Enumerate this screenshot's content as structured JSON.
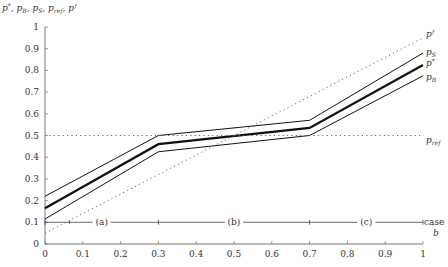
{
  "chart_data": {
    "type": "line",
    "title": "",
    "xlabel": "b",
    "ylabel": "p*, p_B, p_S, p_ref, p†",
    "xlim": [
      0,
      1
    ],
    "ylim": [
      0,
      1
    ],
    "grid": false,
    "x_ticks": [
      0,
      0.1,
      0.2,
      0.3,
      0.4,
      0.5,
      0.6,
      0.7,
      0.8,
      0.9,
      1
    ],
    "x_tick_labels": [
      "0",
      "0.1",
      "0.2",
      "0.3",
      "0.4",
      "0.5",
      "0.6",
      "0.7",
      "0.8",
      "0.9",
      "1"
    ],
    "y_ticks": [
      0,
      0.1,
      0.2,
      0.3,
      0.4,
      0.5,
      0.6,
      0.7,
      0.8,
      0.9,
      1
    ],
    "y_tick_labels": [
      "0",
      "0.1",
      "0.2",
      "0.3",
      "0.4",
      "0.5",
      "0.6",
      "0.7",
      "0.8",
      "0.9",
      "1"
    ],
    "series": [
      {
        "name": "p_S",
        "label": "pS",
        "style": "solid",
        "width": 1,
        "x": [
          0,
          0.3,
          0.7,
          1
        ],
        "values": [
          0.22,
          0.5,
          0.57,
          0.88
        ]
      },
      {
        "name": "p*",
        "label": "p*",
        "style": "solid",
        "width": 2.2,
        "x": [
          0,
          0.3,
          0.7,
          1
        ],
        "values": [
          0.165,
          0.46,
          0.535,
          0.825
        ]
      },
      {
        "name": "p_B",
        "label": "pB",
        "style": "solid",
        "width": 1,
        "x": [
          0,
          0.3,
          0.7,
          1
        ],
        "values": [
          0.115,
          0.425,
          0.5,
          0.775
        ]
      },
      {
        "name": "p†",
        "label": "p†",
        "style": "dotted",
        "width": 1,
        "x": [
          0,
          1
        ],
        "values": [
          0.05,
          0.95
        ]
      },
      {
        "name": "p_ref",
        "label": "pref",
        "style": "dotted",
        "width": 1,
        "x": [
          0,
          1
        ],
        "values": [
          0.5,
          0.5
        ]
      }
    ],
    "case_line": {
      "y": 0.1,
      "label": "case",
      "boundaries": [
        0,
        0.3,
        0.7,
        1
      ],
      "segments": [
        {
          "label": "(a)",
          "x": 0.15
        },
        {
          "label": "(b)",
          "x": 0.5
        },
        {
          "label": "(c)",
          "x": 0.85
        }
      ]
    }
  }
}
